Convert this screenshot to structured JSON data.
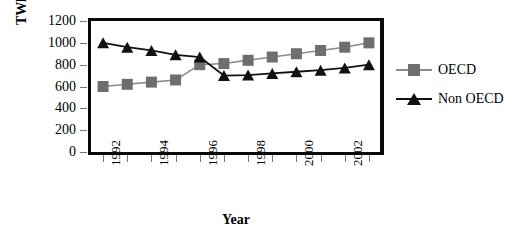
{
  "chart_data": {
    "type": "line",
    "title": "",
    "xlabel": "Year",
    "ylabel": "TWh/year",
    "x": [
      1992,
      1993,
      1994,
      1995,
      1996,
      1997,
      1998,
      1999,
      2000,
      2001,
      2002,
      2003
    ],
    "xtick_labels": [
      "1992",
      "1994",
      "1996",
      "1998",
      "2000",
      "2002"
    ],
    "xtick_values": [
      1992,
      1994,
      1996,
      1998,
      2000,
      2002
    ],
    "ytick_labels": [
      "1200",
      "1000",
      "800",
      "600",
      "400",
      "200",
      "0"
    ],
    "ytick_values": [
      1200,
      1000,
      800,
      600,
      400,
      200,
      0
    ],
    "ylim": [
      0,
      1200
    ],
    "xlim": [
      1991.5,
      2003.5
    ],
    "grid": false,
    "legend_position": "right",
    "series": [
      {
        "name": "OECD",
        "marker": "square",
        "color": "#6e6e6e",
        "line_color": "#8a8a8a",
        "values": [
          600,
          620,
          640,
          660,
          800,
          810,
          840,
          870,
          900,
          930,
          960,
          1000
        ]
      },
      {
        "name": "Non OECD",
        "marker": "triangle",
        "color": "#111111",
        "line_color": "#111111",
        "values": [
          1000,
          960,
          930,
          890,
          870,
          700,
          705,
          720,
          735,
          750,
          770,
          800
        ]
      }
    ]
  },
  "legend": {
    "items": [
      {
        "label": "OECD"
      },
      {
        "label": "Non OECD"
      }
    ]
  }
}
